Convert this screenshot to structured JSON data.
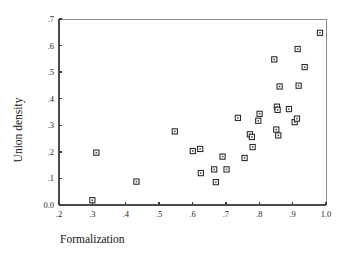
{
  "figure": {
    "background_color": "#ffffff",
    "marker_color": "#262626",
    "axis_color": "#4d4d4d"
  },
  "chart_data": {
    "type": "scatter",
    "title": "",
    "subtitle": "",
    "xlabel": "Formalization",
    "ylabel": "Union density",
    "xlim": [
      0.2,
      1.0
    ],
    "ylim": [
      0.0,
      0.7
    ],
    "xticks": [
      0.2,
      0.3,
      0.4,
      0.5,
      0.6,
      0.7,
      0.8,
      0.9,
      1.0
    ],
    "yticks": [
      0.0,
      0.1,
      0.2,
      0.3,
      0.4,
      0.5,
      0.6,
      0.7
    ],
    "xtick_labels": [
      ".2",
      ".3",
      ".4",
      ".5",
      ".6",
      ".7",
      ".8",
      ".9",
      "1.0"
    ],
    "ytick_labels": [
      "0.0",
      ".1",
      ".2",
      ".3",
      ".4",
      ".5",
      ".6",
      ".7"
    ],
    "grid": false,
    "legend": null,
    "marker": "open-square",
    "points": [
      {
        "x": 0.3,
        "y": 0.018
      },
      {
        "x": 0.312,
        "y": 0.197
      },
      {
        "x": 0.432,
        "y": 0.088
      },
      {
        "x": 0.547,
        "y": 0.277
      },
      {
        "x": 0.601,
        "y": 0.203
      },
      {
        "x": 0.623,
        "y": 0.211
      },
      {
        "x": 0.625,
        "y": 0.12
      },
      {
        "x": 0.665,
        "y": 0.134
      },
      {
        "x": 0.67,
        "y": 0.086
      },
      {
        "x": 0.69,
        "y": 0.182
      },
      {
        "x": 0.702,
        "y": 0.134
      },
      {
        "x": 0.736,
        "y": 0.328
      },
      {
        "x": 0.756,
        "y": 0.177
      },
      {
        "x": 0.772,
        "y": 0.266
      },
      {
        "x": 0.778,
        "y": 0.256
      },
      {
        "x": 0.78,
        "y": 0.218
      },
      {
        "x": 0.797,
        "y": 0.317
      },
      {
        "x": 0.801,
        "y": 0.343
      },
      {
        "x": 0.845,
        "y": 0.548
      },
      {
        "x": 0.851,
        "y": 0.284
      },
      {
        "x": 0.853,
        "y": 0.37
      },
      {
        "x": 0.855,
        "y": 0.358
      },
      {
        "x": 0.857,
        "y": 0.262
      },
      {
        "x": 0.861,
        "y": 0.446
      },
      {
        "x": 0.889,
        "y": 0.361
      },
      {
        "x": 0.906,
        "y": 0.312
      },
      {
        "x": 0.913,
        "y": 0.325
      },
      {
        "x": 0.915,
        "y": 0.587
      },
      {
        "x": 0.918,
        "y": 0.449
      },
      {
        "x": 0.936,
        "y": 0.519
      },
      {
        "x": 0.982,
        "y": 0.648
      }
    ]
  }
}
